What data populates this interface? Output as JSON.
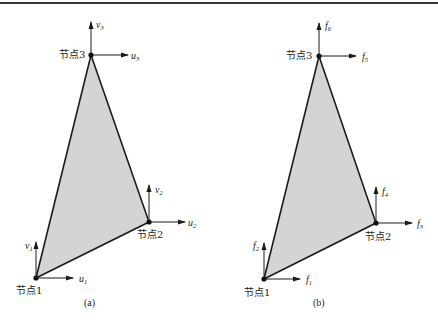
{
  "figure": {
    "top_rule": true,
    "fill_color": "#d4d4d4",
    "edge_color": "#1a1a1a"
  },
  "panel_a": {
    "caption": "(a)",
    "nodes": [
      {
        "label": "节点1",
        "h_var": "u",
        "h_sub": "1",
        "v_var": "v",
        "v_sub": "1"
      },
      {
        "label": "节点2",
        "h_var": "u",
        "h_sub": "2",
        "v_var": "v",
        "v_sub": "2"
      },
      {
        "label": "节点3",
        "h_var": "u",
        "h_sub": "3",
        "v_var": "v",
        "v_sub": "3"
      }
    ]
  },
  "panel_b": {
    "caption": "(b)",
    "nodes": [
      {
        "label": "节点1",
        "h_var": "f",
        "h_sub": "1",
        "v_var": "f",
        "v_sub": "2"
      },
      {
        "label": "节点2",
        "h_var": "f",
        "h_sub": "3",
        "v_var": "f",
        "v_sub": "4"
      },
      {
        "label": "节点3",
        "h_var": "f",
        "h_sub": "5",
        "v_var": "f",
        "v_sub": "6"
      }
    ]
  }
}
